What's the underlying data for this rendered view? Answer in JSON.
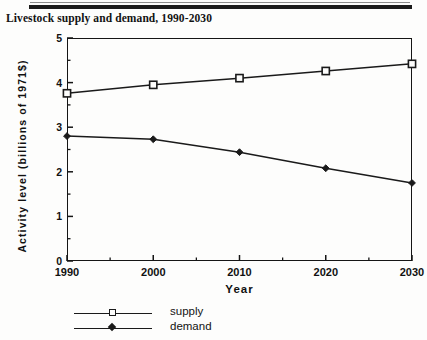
{
  "figure": {
    "title": "Livestock supply and demand, 1990-2030"
  },
  "chart_data": {
    "type": "line",
    "title": "Livestock supply and demand, 1990-2030",
    "xlabel": "Year",
    "ylabel": "Activity level (billions of 1971$)",
    "x": [
      1990,
      2000,
      2010,
      2020,
      2030
    ],
    "xticklabels": [
      "1990",
      "2000",
      "2010",
      "2020",
      "2030"
    ],
    "yticklabels": [
      "0",
      "1",
      "2",
      "3",
      "4",
      "5"
    ],
    "yticks": [
      0,
      1,
      2,
      3,
      4,
      5
    ],
    "xlim": [
      1990,
      2030
    ],
    "ylim": [
      0,
      5
    ],
    "grid": false,
    "minor_ticks": true,
    "legend_position": "below-axes-left",
    "series": [
      {
        "name": "supply",
        "marker": "open-square",
        "color": "#1a1a1a",
        "values": [
          3.76,
          3.95,
          4.1,
          4.26,
          4.42
        ]
      },
      {
        "name": "demand",
        "marker": "filled-diamond",
        "color": "#1a1a1a",
        "values": [
          2.8,
          2.73,
          2.44,
          2.08,
          1.75
        ]
      }
    ]
  },
  "axes": {
    "y_label": "Activity level (billions of 1971$)",
    "x_label": "Year",
    "y_ticks": [
      "5",
      "4",
      "3",
      "2",
      "1",
      "0"
    ],
    "x_ticks": [
      "1990",
      "2000",
      "2010",
      "2020",
      "2030"
    ]
  },
  "legend": {
    "items": [
      {
        "label": "supply",
        "marker": "open-square-marker"
      },
      {
        "label": "demand",
        "marker": "filled-diamond-marker"
      }
    ]
  }
}
